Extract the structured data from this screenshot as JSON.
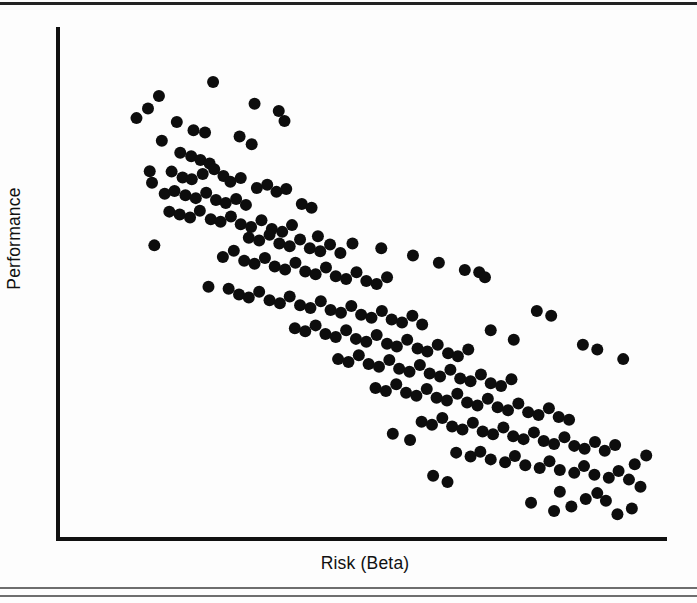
{
  "figure": {
    "background_color": "#fdfdfd",
    "axis_color": "#111111",
    "rule_color_top": "#222222",
    "rule_color_bottom": "#6e6e6e"
  },
  "axes": {
    "x_label": "Risk (Beta)",
    "y_label": "Performance"
  },
  "chart_data": {
    "type": "scatter",
    "title": "",
    "subtitle": "",
    "xlabel": "Risk (Beta)",
    "ylabel": "Performance",
    "xlim": [
      0,
      100
    ],
    "ylim": [
      0,
      100
    ],
    "grid": false,
    "legend": null,
    "x_tick_labels": [],
    "y_tick_labels": [],
    "marker": {
      "shape": "circle",
      "color": "#0d0d0d",
      "diameter_px": 12
    },
    "annotations": [],
    "relationship": "strong negative correlation between Risk (Beta) and Performance",
    "n_points": 212,
    "points": [
      [
        12.5,
        86.0
      ],
      [
        14.4,
        88.6
      ],
      [
        10.5,
        84.0
      ],
      [
        23.8,
        91.5
      ],
      [
        17.5,
        83.2
      ],
      [
        20.4,
        81.5
      ],
      [
        22.4,
        81.0
      ],
      [
        31.0,
        87.0
      ],
      [
        35.2,
        85.5
      ],
      [
        36.2,
        83.4
      ],
      [
        14.9,
        79.3
      ],
      [
        28.4,
        80.2
      ],
      [
        30.5,
        78.6
      ],
      [
        18.1,
        76.8
      ],
      [
        20.0,
        76.1
      ],
      [
        21.6,
        75.3
      ],
      [
        23.2,
        74.6
      ],
      [
        12.8,
        73.0
      ],
      [
        13.2,
        70.6
      ],
      [
        16.6,
        72.9
      ],
      [
        18.5,
        71.7
      ],
      [
        20.1,
        71.3
      ],
      [
        22.0,
        72.4
      ],
      [
        24.0,
        73.4
      ],
      [
        25.6,
        72.0
      ],
      [
        26.8,
        70.8
      ],
      [
        28.6,
        71.6
      ],
      [
        15.4,
        68.3
      ],
      [
        17.1,
        68.9
      ],
      [
        19.0,
        68.0
      ],
      [
        20.8,
        67.4
      ],
      [
        22.6,
        68.5
      ],
      [
        24.3,
        67.0
      ],
      [
        26.0,
        66.4
      ],
      [
        27.8,
        67.2
      ],
      [
        29.5,
        66.0
      ],
      [
        31.4,
        69.5
      ],
      [
        33.2,
        70.2
      ],
      [
        34.8,
        68.7
      ],
      [
        36.5,
        69.3
      ],
      [
        16.2,
        64.6
      ],
      [
        18.0,
        64.0
      ],
      [
        19.8,
        63.4
      ],
      [
        21.5,
        64.8
      ],
      [
        23.4,
        63.0
      ],
      [
        25.1,
        62.5
      ],
      [
        26.9,
        63.6
      ],
      [
        28.6,
        62.0
      ],
      [
        30.4,
        61.4
      ],
      [
        32.2,
        62.8
      ],
      [
        34.0,
        61.0
      ],
      [
        35.8,
        60.4
      ],
      [
        37.5,
        61.8
      ],
      [
        39.2,
        66.2
      ],
      [
        40.9,
        65.4
      ],
      [
        30.0,
        59.2
      ],
      [
        31.8,
        58.6
      ],
      [
        33.6,
        59.8
      ],
      [
        35.3,
        58.0
      ],
      [
        37.1,
        57.4
      ],
      [
        38.9,
        58.8
      ],
      [
        40.6,
        57.0
      ],
      [
        42.4,
        56.4
      ],
      [
        44.1,
        57.8
      ],
      [
        45.9,
        56.0
      ],
      [
        13.6,
        57.6
      ],
      [
        25.5,
        55.2
      ],
      [
        27.4,
        56.5
      ],
      [
        29.2,
        54.4
      ],
      [
        31.0,
        53.8
      ],
      [
        32.8,
        55.0
      ],
      [
        34.5,
        53.2
      ],
      [
        36.3,
        52.6
      ],
      [
        38.1,
        54.0
      ],
      [
        39.8,
        52.2
      ],
      [
        41.6,
        51.6
      ],
      [
        43.4,
        53.0
      ],
      [
        45.1,
        51.2
      ],
      [
        46.9,
        50.6
      ],
      [
        48.7,
        52.0
      ],
      [
        50.4,
        50.2
      ],
      [
        52.2,
        49.6
      ],
      [
        54.0,
        51.0
      ],
      [
        23.0,
        49.0
      ],
      [
        26.5,
        48.6
      ],
      [
        28.3,
        47.4
      ],
      [
        30.0,
        46.8
      ],
      [
        31.8,
        48.0
      ],
      [
        33.6,
        46.2
      ],
      [
        35.4,
        45.6
      ],
      [
        37.1,
        47.0
      ],
      [
        38.9,
        45.2
      ],
      [
        40.7,
        44.6
      ],
      [
        42.5,
        46.0
      ],
      [
        44.2,
        44.2
      ],
      [
        46.0,
        43.6
      ],
      [
        47.8,
        45.0
      ],
      [
        49.5,
        43.2
      ],
      [
        51.3,
        42.6
      ],
      [
        53.1,
        44.0
      ],
      [
        54.8,
        42.2
      ],
      [
        56.6,
        41.6
      ],
      [
        58.4,
        43.0
      ],
      [
        60.1,
        41.2
      ],
      [
        38.0,
        40.4
      ],
      [
        39.8,
        39.8
      ],
      [
        41.6,
        41.0
      ],
      [
        43.3,
        39.2
      ],
      [
        45.1,
        38.6
      ],
      [
        46.9,
        40.0
      ],
      [
        48.6,
        38.2
      ],
      [
        50.4,
        37.6
      ],
      [
        52.2,
        39.0
      ],
      [
        54.0,
        37.2
      ],
      [
        55.7,
        36.6
      ],
      [
        57.5,
        38.0
      ],
      [
        59.3,
        36.2
      ],
      [
        61.0,
        35.6
      ],
      [
        62.8,
        37.0
      ],
      [
        64.6,
        35.2
      ],
      [
        66.3,
        34.6
      ],
      [
        68.1,
        36.0
      ],
      [
        45.5,
        34.0
      ],
      [
        47.3,
        33.4
      ],
      [
        49.1,
        34.8
      ],
      [
        50.8,
        33.0
      ],
      [
        52.6,
        32.4
      ],
      [
        54.4,
        33.8
      ],
      [
        56.1,
        32.0
      ],
      [
        57.9,
        31.4
      ],
      [
        59.7,
        32.8
      ],
      [
        61.4,
        31.0
      ],
      [
        63.2,
        30.4
      ],
      [
        65.0,
        31.8
      ],
      [
        66.7,
        30.0
      ],
      [
        68.5,
        29.4
      ],
      [
        70.3,
        30.8
      ],
      [
        72.0,
        29.0
      ],
      [
        73.8,
        28.4
      ],
      [
        75.6,
        29.8
      ],
      [
        52.0,
        28.0
      ],
      [
        53.8,
        27.4
      ],
      [
        55.6,
        28.8
      ],
      [
        57.3,
        27.0
      ],
      [
        59.1,
        26.4
      ],
      [
        60.9,
        27.8
      ],
      [
        62.6,
        26.0
      ],
      [
        64.4,
        25.4
      ],
      [
        66.2,
        26.8
      ],
      [
        67.9,
        25.0
      ],
      [
        69.7,
        24.4
      ],
      [
        71.5,
        25.8
      ],
      [
        73.2,
        24.0
      ],
      [
        75.0,
        23.4
      ],
      [
        76.8,
        24.8
      ],
      [
        78.5,
        23.0
      ],
      [
        80.3,
        22.4
      ],
      [
        82.1,
        23.8
      ],
      [
        83.8,
        22.0
      ],
      [
        85.6,
        21.4
      ],
      [
        60.0,
        21.0
      ],
      [
        61.8,
        20.4
      ],
      [
        63.6,
        21.8
      ],
      [
        65.3,
        20.0
      ],
      [
        67.1,
        19.4
      ],
      [
        68.9,
        20.8
      ],
      [
        70.6,
        19.0
      ],
      [
        72.4,
        18.4
      ],
      [
        74.2,
        19.8
      ],
      [
        75.9,
        18.0
      ],
      [
        77.7,
        17.4
      ],
      [
        79.5,
        18.8
      ],
      [
        81.2,
        17.0
      ],
      [
        83.0,
        16.4
      ],
      [
        84.8,
        17.8
      ],
      [
        86.5,
        16.0
      ],
      [
        88.3,
        15.4
      ],
      [
        90.1,
        16.8
      ],
      [
        91.8,
        15.0
      ],
      [
        93.6,
        16.2
      ],
      [
        66.0,
        14.6
      ],
      [
        68.5,
        13.8
      ],
      [
        70.2,
        14.8
      ],
      [
        72.0,
        13.2
      ],
      [
        74.5,
        12.6
      ],
      [
        76.2,
        13.9
      ],
      [
        78.0,
        12.0
      ],
      [
        80.5,
        11.4
      ],
      [
        82.2,
        12.8
      ],
      [
        84.0,
        11.0
      ],
      [
        86.5,
        10.4
      ],
      [
        88.2,
        11.8
      ],
      [
        90.0,
        10.0
      ],
      [
        92.5,
        9.4
      ],
      [
        94.2,
        10.8
      ],
      [
        96.0,
        9.0
      ],
      [
        97.0,
        12.2
      ],
      [
        70.0,
        52.0
      ],
      [
        72.0,
        40.0
      ],
      [
        76.0,
        38.0
      ],
      [
        80.0,
        44.0
      ],
      [
        82.5,
        43.0
      ],
      [
        88.0,
        37.0
      ],
      [
        90.5,
        36.0
      ],
      [
        95.0,
        34.0
      ],
      [
        84.0,
        6.5
      ],
      [
        88.5,
        5.0
      ],
      [
        90.5,
        6.2
      ],
      [
        83.0,
        2.5
      ],
      [
        94.0,
        1.8
      ],
      [
        55.0,
        18.5
      ],
      [
        58.0,
        17.2
      ],
      [
        62.0,
        9.8
      ],
      [
        64.5,
        8.5
      ],
      [
        79.0,
        4.2
      ],
      [
        86.0,
        3.4
      ],
      [
        92.0,
        4.6
      ],
      [
        96.5,
        3.0
      ],
      [
        98.0,
        7.5
      ],
      [
        99.0,
        14.0
      ],
      [
        42.0,
        59.5
      ],
      [
        48.0,
        58.0
      ],
      [
        53.0,
        57.0
      ],
      [
        58.5,
        55.5
      ],
      [
        63.0,
        54.0
      ],
      [
        67.5,
        52.5
      ],
      [
        71.0,
        51.0
      ]
    ]
  }
}
